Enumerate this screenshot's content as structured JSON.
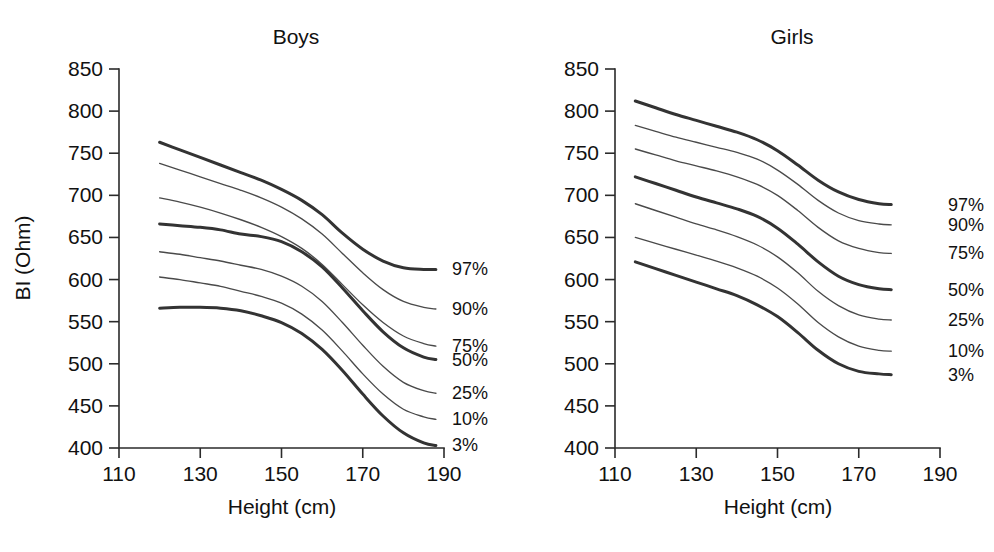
{
  "figure": {
    "background_color": "#ffffff",
    "curve_color_thin": "#4a4a4a",
    "curve_color_thick": "#333333",
    "axis_color": "#2b2b2b"
  },
  "chart_data": [
    {
      "type": "line",
      "title": "Boys",
      "xlabel": "Height (cm)",
      "ylabel": "BI (Ohm)",
      "xlim": [
        110,
        190
      ],
      "ylim": [
        400,
        850
      ],
      "xticks": [
        110,
        130,
        150,
        170,
        190
      ],
      "yticks": [
        400,
        450,
        500,
        550,
        600,
        650,
        700,
        750,
        800,
        850
      ],
      "xticks_minor": [
        120,
        140,
        160,
        180
      ],
      "grid": false,
      "legend_position": "right-inline",
      "series": [
        {
          "name": "97%",
          "emphasis": "thick",
          "x": [
            120,
            125,
            130,
            135,
            140,
            145,
            150,
            155,
            160,
            165,
            170,
            175,
            180,
            185,
            188
          ],
          "y": [
            763,
            754,
            745,
            736,
            727,
            718,
            707,
            694,
            677,
            655,
            636,
            622,
            614,
            612,
            612
          ]
        },
        {
          "name": "90%",
          "emphasis": "thin",
          "x": [
            120,
            125,
            130,
            135,
            140,
            145,
            150,
            155,
            160,
            165,
            170,
            175,
            180,
            185,
            188
          ],
          "y": [
            738,
            730,
            722,
            714,
            706,
            697,
            686,
            672,
            654,
            631,
            608,
            588,
            574,
            567,
            565
          ]
        },
        {
          "name": "75%",
          "emphasis": "thin",
          "x": [
            120,
            125,
            130,
            135,
            140,
            145,
            150,
            155,
            160,
            165,
            170,
            175,
            180,
            185,
            188
          ],
          "y": [
            697,
            692,
            686,
            679,
            671,
            662,
            651,
            637,
            618,
            594,
            570,
            549,
            533,
            524,
            521
          ]
        },
        {
          "name": "50%",
          "emphasis": "thick",
          "x": [
            120,
            125,
            130,
            135,
            140,
            145,
            150,
            155,
            160,
            165,
            170,
            175,
            180,
            185,
            188
          ],
          "y": [
            666,
            664,
            662,
            659,
            654,
            651,
            645,
            633,
            615,
            590,
            563,
            538,
            519,
            508,
            505
          ]
        },
        {
          "name": "25%",
          "emphasis": "thin",
          "x": [
            120,
            125,
            130,
            135,
            140,
            145,
            150,
            155,
            160,
            165,
            170,
            175,
            180,
            185,
            188
          ],
          "y": [
            633,
            630,
            626,
            622,
            617,
            612,
            604,
            592,
            574,
            549,
            522,
            497,
            478,
            468,
            465
          ]
        },
        {
          "name": "10%",
          "emphasis": "thin",
          "x": [
            120,
            125,
            130,
            135,
            140,
            145,
            150,
            155,
            160,
            165,
            170,
            175,
            180,
            185,
            188
          ],
          "y": [
            603,
            600,
            596,
            592,
            586,
            580,
            572,
            559,
            540,
            515,
            488,
            464,
            446,
            437,
            434
          ]
        },
        {
          "name": "3%",
          "emphasis": "thick",
          "x": [
            120,
            125,
            130,
            135,
            140,
            145,
            150,
            155,
            160,
            165,
            170,
            175,
            180,
            185,
            188
          ],
          "y": [
            566,
            567,
            567,
            566,
            563,
            557,
            549,
            536,
            517,
            492,
            464,
            438,
            418,
            406,
            403
          ]
        }
      ],
      "percentile_labels": [
        {
          "text": "97%",
          "value": 97
        },
        {
          "text": "90%",
          "value": 90
        },
        {
          "text": "75%",
          "value": 75
        },
        {
          "text": "50%",
          "value": 50
        },
        {
          "text": "25%",
          "value": 25
        },
        {
          "text": "10%",
          "value": 10
        },
        {
          "text": "3%",
          "value": 3
        }
      ]
    },
    {
      "type": "line",
      "title": "Girls",
      "xlabel": "Height (cm)",
      "ylabel": "BI (Ohm)",
      "xlim": [
        110,
        190
      ],
      "ylim": [
        400,
        850
      ],
      "xticks": [
        110,
        130,
        150,
        170,
        190
      ],
      "yticks": [
        400,
        450,
        500,
        550,
        600,
        650,
        700,
        750,
        800,
        850
      ],
      "xticks_minor": [
        120,
        140,
        160,
        180
      ],
      "grid": false,
      "legend_position": "right-inline",
      "series": [
        {
          "name": "97%",
          "emphasis": "thick",
          "x": [
            115,
            120,
            125,
            130,
            135,
            140,
            145,
            150,
            155,
            160,
            165,
            170,
            175,
            178
          ],
          "y": [
            812,
            804,
            796,
            789,
            782,
            775,
            766,
            753,
            736,
            718,
            704,
            695,
            690,
            689
          ]
        },
        {
          "name": "90%",
          "emphasis": "thin",
          "x": [
            115,
            120,
            125,
            130,
            135,
            140,
            145,
            150,
            155,
            160,
            165,
            170,
            175,
            178
          ],
          "y": [
            783,
            776,
            769,
            763,
            757,
            751,
            743,
            730,
            713,
            694,
            679,
            670,
            666,
            665
          ]
        },
        {
          "name": "75%",
          "emphasis": "thin",
          "x": [
            115,
            120,
            125,
            130,
            135,
            140,
            145,
            150,
            155,
            160,
            165,
            170,
            175,
            178
          ],
          "y": [
            755,
            748,
            741,
            735,
            729,
            722,
            713,
            700,
            682,
            662,
            646,
            637,
            632,
            631
          ]
        },
        {
          "name": "50%",
          "emphasis": "thick",
          "x": [
            115,
            120,
            125,
            130,
            135,
            140,
            145,
            150,
            155,
            160,
            165,
            170,
            175,
            178
          ],
          "y": [
            722,
            714,
            706,
            698,
            691,
            684,
            675,
            661,
            642,
            621,
            604,
            594,
            589,
            588
          ]
        },
        {
          "name": "25%",
          "emphasis": "thin",
          "x": [
            115,
            120,
            125,
            130,
            135,
            140,
            145,
            150,
            155,
            160,
            165,
            170,
            175,
            178
          ],
          "y": [
            690,
            682,
            674,
            666,
            659,
            651,
            641,
            627,
            608,
            586,
            569,
            558,
            553,
            552
          ]
        },
        {
          "name": "10%",
          "emphasis": "thin",
          "x": [
            115,
            120,
            125,
            130,
            135,
            140,
            145,
            150,
            155,
            160,
            165,
            170,
            175,
            178
          ],
          "y": [
            650,
            643,
            636,
            629,
            622,
            614,
            604,
            590,
            571,
            549,
            532,
            521,
            516,
            515
          ]
        },
        {
          "name": "3%",
          "emphasis": "thick",
          "x": [
            115,
            120,
            125,
            130,
            135,
            140,
            145,
            150,
            155,
            160,
            165,
            170,
            175,
            178
          ],
          "y": [
            621,
            613,
            605,
            597,
            589,
            581,
            570,
            556,
            537,
            516,
            500,
            491,
            488,
            487
          ]
        }
      ],
      "percentile_labels": [
        {
          "text": "97%",
          "value": 97
        },
        {
          "text": "90%",
          "value": 90
        },
        {
          "text": "75%",
          "value": 75
        },
        {
          "text": "50%",
          "value": 50
        },
        {
          "text": "25%",
          "value": 25
        },
        {
          "text": "10%",
          "value": 10
        },
        {
          "text": "3%",
          "value": 3
        }
      ]
    }
  ]
}
